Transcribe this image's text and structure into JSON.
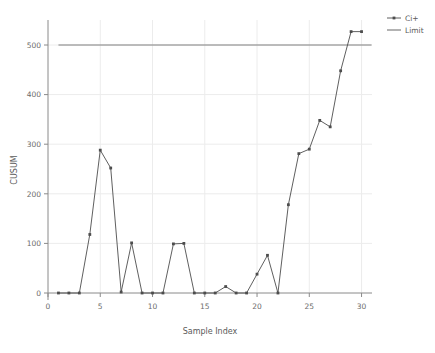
{
  "chart_data": {
    "type": "line",
    "title": "",
    "xlabel": "Sample Index",
    "ylabel": "CUSUM",
    "xlim": [
      0,
      31
    ],
    "ylim": [
      -20,
      560
    ],
    "xticks": [
      0,
      5,
      10,
      15,
      20,
      25,
      30
    ],
    "xticklabels": [
      "0",
      "5",
      "10",
      "15",
      "20",
      "25",
      "30"
    ],
    "yticks": [
      0,
      100,
      200,
      300,
      400,
      500
    ],
    "yticklabels": [
      "0",
      "100",
      "200",
      "300",
      "400",
      "500"
    ],
    "grid": true,
    "legend_position": "upper right",
    "x": [
      1,
      2,
      3,
      4,
      5,
      6,
      7,
      8,
      9,
      10,
      11,
      12,
      13,
      14,
      15,
      16,
      17,
      18,
      19,
      20,
      21,
      22,
      23,
      24,
      25,
      26,
      27,
      28,
      29,
      30
    ],
    "series": [
      {
        "name": "Ci+",
        "color": "#4d4d4d",
        "marker": "square",
        "values": [
          0,
          0,
          0,
          118,
          288,
          252,
          2,
          101,
          0,
          0,
          0,
          99,
          100,
          0,
          0,
          0,
          13,
          0,
          0,
          38,
          76,
          0,
          178,
          281,
          290,
          348,
          335,
          448,
          527,
          527
        ]
      },
      {
        "name": "Limit",
        "color": "#808080",
        "marker": "none",
        "type": "hline",
        "value": 500,
        "values": [
          500,
          500,
          500,
          500,
          500,
          500,
          500,
          500,
          500,
          500,
          500,
          500,
          500,
          500,
          500,
          500,
          500,
          500,
          500,
          500,
          500,
          500,
          500,
          500,
          500,
          500,
          500,
          500,
          500,
          500
        ]
      }
    ],
    "legend": [
      {
        "label": "Ci+",
        "color": "#4d4d4d",
        "marker": "square"
      },
      {
        "label": "Limit",
        "color": "#808080",
        "marker": "none"
      }
    ]
  },
  "colors": {
    "background": "#ffffff",
    "axis": "#8a8a8a",
    "grid": "#ececec",
    "series_ci": "#4d4d4d",
    "series_limit": "#808080",
    "text": "#5a5a5a"
  }
}
